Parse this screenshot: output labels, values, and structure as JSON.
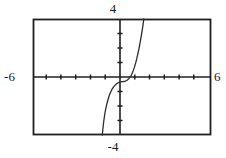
{
  "chart_data": {
    "type": "line",
    "title": "",
    "subtitle": "",
    "xlabel": "",
    "ylabel": "",
    "grid": false,
    "legend": null,
    "legend_position": "none",
    "xlim": [
      -6,
      6
    ],
    "ylim": [
      -4,
      4
    ],
    "xtick_step": 1,
    "ytick_step": 1,
    "xtick_labels": [
      "-6",
      "6"
    ],
    "ytick_labels": [
      "-4",
      "4"
    ],
    "annotations": [
      {
        "name": "window-ymax",
        "text": "4",
        "position": "top-center"
      },
      {
        "name": "window-ymin",
        "text": "-4",
        "position": "bottom-center"
      },
      {
        "name": "window-xmin",
        "text": "-6",
        "position": "left-middle"
      },
      {
        "name": "window-xmax",
        "text": "6",
        "position": "right-middle"
      }
    ],
    "series": [
      {
        "name": "curve",
        "color": "#2b2b2b",
        "style": "solid",
        "width": 1.3,
        "description": "increasing cubic-like curve through the origin with a flat inflection, steeply rising at both ends",
        "points": [
          [
            -1.33,
            -4.0
          ],
          [
            -1.28,
            -3.5
          ],
          [
            -1.23,
            -3.05
          ],
          [
            -1.17,
            -2.62
          ],
          [
            -1.1,
            -2.22
          ],
          [
            -1.02,
            -1.86
          ],
          [
            -0.94,
            -1.55
          ],
          [
            -0.86,
            -1.28
          ],
          [
            -0.77,
            -1.05
          ],
          [
            -0.68,
            -0.86
          ],
          [
            -0.58,
            -0.7
          ],
          [
            -0.48,
            -0.58
          ],
          [
            -0.38,
            -0.48
          ],
          [
            -0.28,
            -0.41
          ],
          [
            -0.18,
            -0.36
          ],
          [
            -0.08,
            -0.33
          ],
          [
            0.02,
            -0.32
          ],
          [
            0.12,
            -0.31
          ],
          [
            0.22,
            -0.29
          ],
          [
            0.32,
            -0.24
          ],
          [
            0.42,
            -0.16
          ],
          [
            0.52,
            -0.04
          ],
          [
            0.6,
            0.08
          ],
          [
            0.68,
            0.24
          ],
          [
            0.76,
            0.44
          ],
          [
            0.84,
            0.68
          ],
          [
            0.92,
            0.96
          ],
          [
            1.0,
            1.28
          ],
          [
            1.08,
            1.64
          ],
          [
            1.16,
            2.04
          ],
          [
            1.24,
            2.48
          ],
          [
            1.32,
            2.96
          ],
          [
            1.4,
            3.48
          ],
          [
            1.47,
            4.0
          ]
        ]
      }
    ]
  },
  "plot": {
    "frame": {
      "left": 33,
      "top": 19,
      "right": 211,
      "bottom": 135
    },
    "origin": {
      "x": 120,
      "y": 77
    },
    "frame_color": "#1f1f1f",
    "axis_color": "#1f1f1f",
    "curve_color": "#2b2b2b",
    "background": "#ffffff"
  },
  "labels": {
    "top": "4",
    "bottom": "-4",
    "left": "-6",
    "right": "6"
  }
}
